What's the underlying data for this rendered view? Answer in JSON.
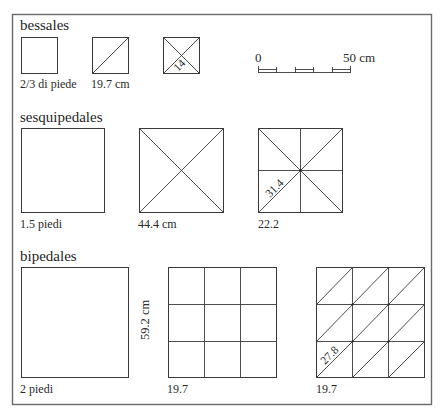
{
  "diagram": {
    "scale_bar": {
      "start_label": "0",
      "end_label": "50 cm",
      "segments": 5
    },
    "sections": [
      {
        "id": "bessales",
        "title": "bessales",
        "tiles": [
          {
            "type": "plain",
            "label": "2/3 di piede"
          },
          {
            "type": "one-diagonal",
            "label": "19.7 cm"
          },
          {
            "type": "two-diagonals",
            "label": "",
            "inner_label": "14"
          }
        ]
      },
      {
        "id": "sesquipedales",
        "title": "sesquipedales",
        "tiles": [
          {
            "type": "plain",
            "label": "1.5 piedi"
          },
          {
            "type": "two-diagonals",
            "label": "44.4 cm"
          },
          {
            "type": "eight-triangles",
            "label": "22.2",
            "inner_label": "31.4"
          }
        ]
      },
      {
        "id": "bipedales",
        "title": "bipedales",
        "side_dimension": "59.2 cm",
        "tiles": [
          {
            "type": "plain",
            "label": "2 piedi"
          },
          {
            "type": "grid-3x3",
            "label": "19.7"
          },
          {
            "type": "grid-3x3-diagonals",
            "label": "19.7",
            "inner_label": "27.8"
          }
        ]
      }
    ]
  }
}
